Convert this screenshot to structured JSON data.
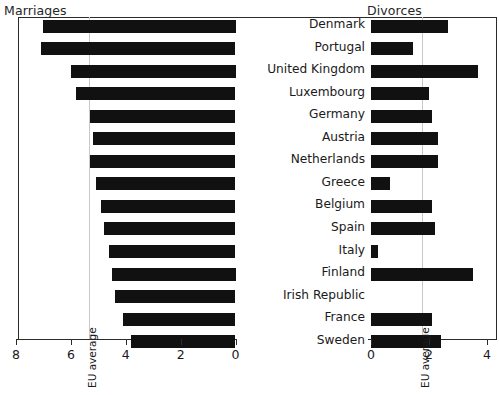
{
  "figure": {
    "left_header": "Marriages",
    "right_header": "Divorces",
    "eu_average_caption": "EU average",
    "bar_color": "#111111",
    "guide_color": "#c9c9c9",
    "axis_color": "#2b2b2b"
  },
  "chart_data": {
    "type": "bar",
    "title": "",
    "orientation": "horizontal",
    "layout": "back-to-back paired panels (butterfly chart)",
    "grid": false,
    "legend": "none",
    "categories": [
      "Denmark",
      "Portugal",
      "United Kingdom",
      "Luxembourg",
      "Germany",
      "Austria",
      "Netherlands",
      "Greece",
      "Belgium",
      "Spain",
      "Italy",
      "Finland",
      "Irish Republic",
      "France",
      "Sweden"
    ],
    "series": [
      {
        "name": "Marriages",
        "panel": "left",
        "xlabel": "Marriages",
        "ylabel": "",
        "xlim": [
          8,
          0
        ],
        "axis_direction": "reversed",
        "ticks": [
          8,
          6,
          4,
          2,
          0
        ],
        "tick_labels": [
          "8",
          "6",
          "4",
          "2",
          "0"
        ],
        "reference_line": {
          "label": "EU average",
          "value": 5.3
        },
        "values": [
          7.0,
          7.1,
          6.0,
          5.8,
          5.3,
          5.2,
          5.3,
          5.1,
          4.9,
          4.8,
          4.6,
          4.5,
          4.4,
          4.1,
          3.8
        ]
      },
      {
        "name": "Divorces",
        "panel": "right",
        "xlabel": "Divorces",
        "ylabel": "",
        "xlim": [
          0,
          4.4
        ],
        "axis_direction": "normal",
        "ticks": [
          0,
          2,
          4
        ],
        "tick_labels": [
          "0",
          "2",
          "4"
        ],
        "reference_line": {
          "label": "EU average",
          "value": 1.75
        },
        "values": [
          2.65,
          1.45,
          3.7,
          2.0,
          2.1,
          2.3,
          2.3,
          0.65,
          2.1,
          2.2,
          0.25,
          3.5,
          0.0,
          2.1,
          2.4
        ]
      }
    ]
  }
}
